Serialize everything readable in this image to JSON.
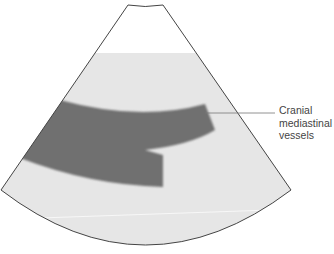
{
  "diagram": {
    "type": "ultrasound-sector-schematic",
    "colors": {
      "background": "#ffffff",
      "near_field": "#ffffff",
      "tissue": "#e6e6e6",
      "vessel": "#6f6f6f",
      "outline": "#444444",
      "leader_line": "#777777",
      "label_text": "#444444"
    },
    "annotations": [
      {
        "label_lines": [
          "Cranial",
          "mediastinal",
          "vessels"
        ],
        "target": "vessel-band"
      }
    ]
  }
}
